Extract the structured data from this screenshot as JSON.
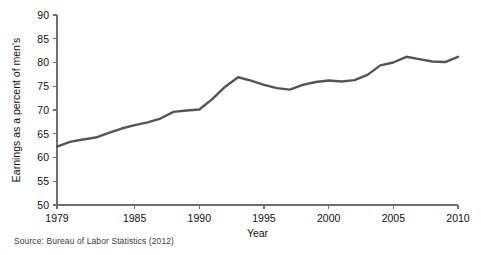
{
  "figure": {
    "source_note": "Source: Bureau of Labor Statistics (2012)",
    "background_color": "#ffffff",
    "line_color": "#555555",
    "axis_color": "#6f6f6f",
    "text_color": "#111111"
  },
  "chart_data": {
    "type": "line",
    "title": "",
    "xlabel": "Year",
    "ylabel": "Earnings as a percent of men's",
    "xlim": [
      1979,
      2010
    ],
    "ylim": [
      50,
      90
    ],
    "xticks": [
      1979,
      1985,
      1990,
      1995,
      2000,
      2005,
      2010
    ],
    "xtick_labels": [
      "1979",
      "1985",
      "1990",
      "1995",
      "2000",
      "2005",
      "2010"
    ],
    "yticks": [
      50,
      55,
      60,
      65,
      70,
      75,
      80,
      85,
      90
    ],
    "ytick_labels": [
      "50",
      "55",
      "60",
      "65",
      "70",
      "75",
      "80",
      "85",
      "90"
    ],
    "grid": false,
    "legend": false,
    "legend_position": "none",
    "series": [
      {
        "name": "Women's earnings as a percent of men's",
        "x": [
          1979,
          1980,
          1981,
          1982,
          1983,
          1984,
          1985,
          1986,
          1987,
          1988,
          1989,
          1990,
          1991,
          1992,
          1993,
          1994,
          1995,
          1996,
          1997,
          1998,
          1999,
          2000,
          2001,
          2002,
          2003,
          2004,
          2005,
          2006,
          2007,
          2008,
          2009,
          2010
        ],
        "values": [
          62.3,
          63.3,
          63.8,
          64.2,
          65.2,
          66.1,
          66.8,
          67.4,
          68.2,
          69.6,
          69.9,
          70.1,
          72.3,
          74.9,
          76.9,
          76.2,
          75.3,
          74.6,
          74.3,
          75.3,
          75.9,
          76.2,
          76.0,
          76.3,
          77.4,
          79.4,
          80.0,
          81.2,
          80.7,
          80.2,
          80.1,
          81.2
        ]
      }
    ],
    "annotations": []
  }
}
